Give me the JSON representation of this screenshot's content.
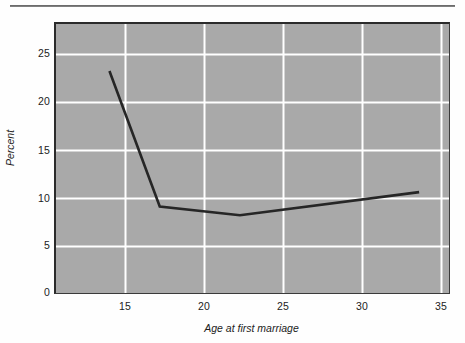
{
  "chart_data": {
    "type": "line",
    "title": "",
    "xlabel": "Age at first marriage",
    "ylabel": "Percent",
    "xlim": [
      11.5,
      36.5
    ],
    "ylim": [
      0,
      28
    ],
    "xticks": [
      15,
      20,
      25,
      30,
      35
    ],
    "xtick_labels": [
      "15",
      "20",
      "25",
      "30",
      "35"
    ],
    "yticks": [
      0,
      5,
      10,
      15,
      20,
      25
    ],
    "ytick_labels": [
      "0",
      "5",
      "10",
      "15",
      "20",
      "25"
    ],
    "grid": true,
    "grid_color": "#ffffff",
    "plot_background": "#a9a9a9",
    "page_background": "#ffffff",
    "line_color": "#262626",
    "line_width": 2.6,
    "legend": null,
    "series": [
      {
        "name": "Percent",
        "x": [
          14.9,
          18.1,
          23.2,
          34.6
        ],
        "y": [
          23.1,
          9.0,
          8.1,
          10.5
        ]
      }
    ]
  },
  "figure": {
    "top_rule_color": "#4a4a4a",
    "axis_color": "#2b2b2b"
  }
}
